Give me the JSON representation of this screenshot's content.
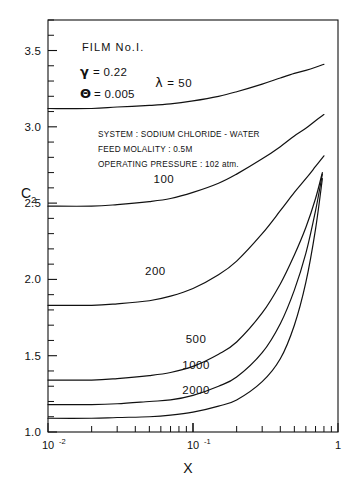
{
  "figure": {
    "film_label": "FILM No.I.",
    "params": [
      {
        "symbol": "γ",
        "text": "= 0.22"
      },
      {
        "symbol": "Θ",
        "text": "= 0.005"
      }
    ],
    "notes": [
      "SYSTEM : SODIUM CHLORIDE - WATER",
      "FEED MOLALITY : 0.5M",
      "OPERATING PRESSURE : 102 atm."
    ],
    "lambda_symbol": "λ",
    "lambda_lead_label": "= 50"
  },
  "chart_data": {
    "type": "line",
    "title": "",
    "xlabel": "X",
    "ylabel": "C",
    "ylabel_sub": "2",
    "xscale": "log",
    "yscale": "linear",
    "xlim": [
      0.01,
      1.0
    ],
    "ylim": [
      1.0,
      3.7
    ],
    "grid": false,
    "legend": "inline-curve-labels",
    "x_tick_labels": [
      {
        "value": 0.01,
        "text": "10",
        "exp": "-2"
      },
      {
        "value": 0.1,
        "text": "10",
        "exp": "-1"
      },
      {
        "value": 1.0,
        "text": "1",
        "exp": ""
      }
    ],
    "y_tick_labels": [
      {
        "value": 1.0,
        "text": "1.0"
      },
      {
        "value": 1.5,
        "text": "1.5"
      },
      {
        "value": 2.0,
        "text": "2.0"
      },
      {
        "value": 2.5,
        "text": "2.5"
      },
      {
        "value": 3.0,
        "text": "3.0"
      },
      {
        "value": 3.5,
        "text": "3.5"
      }
    ],
    "y_minor_ticks": [
      1.1,
      1.2,
      1.3,
      1.4,
      1.6,
      1.7,
      1.8,
      1.9,
      2.1,
      2.2,
      2.3,
      2.4,
      2.6,
      2.7,
      2.8,
      2.9,
      3.1,
      3.2,
      3.3,
      3.4,
      3.6,
      3.7
    ],
    "series": [
      {
        "name": "50",
        "label": "λ = 50",
        "label_x": 0.055,
        "label_y": 3.26,
        "x": [
          0.01,
          0.02,
          0.03,
          0.05,
          0.07,
          0.1,
          0.15,
          0.2,
          0.3,
          0.4,
          0.5,
          0.6,
          0.7,
          0.8
        ],
        "y": [
          3.12,
          3.12,
          3.13,
          3.14,
          3.15,
          3.17,
          3.2,
          3.23,
          3.28,
          3.32,
          3.35,
          3.37,
          3.39,
          3.41
        ]
      },
      {
        "name": "100",
        "label": "100",
        "label_x": 0.063,
        "label_y": 2.63,
        "x": [
          0.01,
          0.02,
          0.03,
          0.05,
          0.07,
          0.1,
          0.15,
          0.2,
          0.3,
          0.4,
          0.5,
          0.6,
          0.7,
          0.8
        ],
        "y": [
          2.48,
          2.48,
          2.49,
          2.51,
          2.53,
          2.57,
          2.63,
          2.69,
          2.79,
          2.87,
          2.94,
          2.99,
          3.04,
          3.08
        ]
      },
      {
        "name": "200",
        "label": "200",
        "label_x": 0.055,
        "label_y": 2.03,
        "x": [
          0.01,
          0.02,
          0.03,
          0.05,
          0.07,
          0.1,
          0.15,
          0.2,
          0.3,
          0.4,
          0.5,
          0.6,
          0.7,
          0.8
        ],
        "y": [
          1.83,
          1.83,
          1.84,
          1.86,
          1.89,
          1.94,
          2.03,
          2.12,
          2.3,
          2.45,
          2.57,
          2.66,
          2.74,
          2.81
        ]
      },
      {
        "name": "500",
        "label": "500",
        "label_x": 0.105,
        "label_y": 1.58,
        "x": [
          0.01,
          0.02,
          0.03,
          0.05,
          0.07,
          0.1,
          0.15,
          0.2,
          0.3,
          0.4,
          0.5,
          0.6,
          0.7,
          0.78
        ],
        "y": [
          1.34,
          1.34,
          1.35,
          1.37,
          1.39,
          1.43,
          1.51,
          1.59,
          1.78,
          1.97,
          2.16,
          2.34,
          2.53,
          2.7
        ]
      },
      {
        "name": "1000",
        "label": "1000",
        "label_x": 0.105,
        "label_y": 1.41,
        "x": [
          0.01,
          0.02,
          0.03,
          0.05,
          0.07,
          0.1,
          0.15,
          0.2,
          0.3,
          0.4,
          0.5,
          0.6,
          0.7,
          0.78
        ],
        "y": [
          1.18,
          1.18,
          1.185,
          1.2,
          1.21,
          1.24,
          1.3,
          1.36,
          1.52,
          1.71,
          1.93,
          2.17,
          2.45,
          2.69
        ]
      },
      {
        "name": "2000",
        "label": "2000",
        "label_x": 0.105,
        "label_y": 1.25,
        "x": [
          0.01,
          0.02,
          0.03,
          0.05,
          0.07,
          0.1,
          0.15,
          0.2,
          0.3,
          0.4,
          0.5,
          0.6,
          0.7,
          0.78
        ],
        "y": [
          1.09,
          1.09,
          1.095,
          1.1,
          1.11,
          1.13,
          1.17,
          1.21,
          1.33,
          1.48,
          1.7,
          1.98,
          2.33,
          2.66
        ]
      }
    ]
  }
}
